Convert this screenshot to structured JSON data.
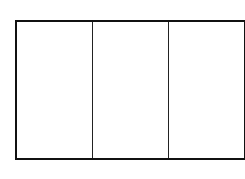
{
  "diagram": {
    "type": "rectangle-divided",
    "sections": [
      {
        "id": "section-1",
        "label": ""
      },
      {
        "id": "section-2",
        "label": ""
      },
      {
        "id": "section-3",
        "label": ""
      }
    ],
    "stroke_color": "#111111",
    "fill_color": "#ffffff"
  }
}
